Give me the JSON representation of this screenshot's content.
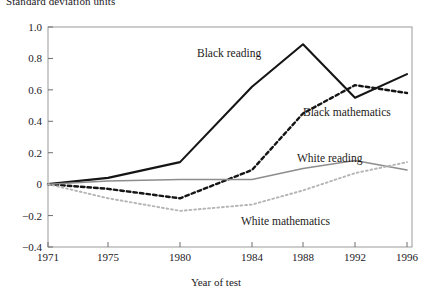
{
  "figure": {
    "y_axis_title": "Standard deviation units",
    "x_axis_title": "Year of test"
  },
  "chart_data": {
    "type": "line",
    "title": "",
    "ylabel": "Standard deviation units",
    "xlabel": "Year of test",
    "xlim": [
      1971,
      1996
    ],
    "ylim": [
      -0.4,
      1.0
    ],
    "grid": false,
    "legend_position": "inline-annotations",
    "xticks": [
      1971,
      1975,
      1980,
      1984,
      1988,
      1992,
      1996
    ],
    "xtick_labels": [
      "1971",
      "1975",
      "1980",
      "1984",
      "1988",
      "1992",
      "1996"
    ],
    "yticks": [
      -0.4,
      -0.2,
      0,
      0.2,
      0.4,
      0.6,
      0.8,
      1.0
    ],
    "ytick_labels": [
      "-0.4",
      "-0.2",
      "0",
      "0.2",
      "0.4",
      "0.6",
      "0.8",
      "1.0"
    ],
    "x": [
      1971,
      1975,
      1980,
      1984,
      1988,
      1992,
      1996
    ],
    "series": [
      {
        "name": "Black reading",
        "style": "solid",
        "color": "#151515",
        "width": 2.1,
        "values": [
          0.0,
          0.04,
          0.14,
          0.62,
          0.89,
          0.55,
          0.7
        ]
      },
      {
        "name": "Black mathematics",
        "style": "dashed",
        "color": "#151515",
        "width": 2.4,
        "values": [
          0.0,
          -0.03,
          -0.09,
          0.09,
          0.45,
          0.63,
          0.58
        ]
      },
      {
        "name": "White reading",
        "style": "solid",
        "color": "#8d8d8d",
        "width": 1.5,
        "values": [
          0.0,
          0.02,
          0.03,
          0.03,
          0.1,
          0.15,
          0.09
        ]
      },
      {
        "name": "White mathematics",
        "style": "dotted",
        "color": "#b5b5b5",
        "width": 1.9,
        "values": [
          0.0,
          -0.09,
          -0.17,
          -0.13,
          -0.04,
          0.07,
          0.14
        ]
      }
    ],
    "annotations": [
      {
        "text": "Black reading",
        "x_px": 197,
        "y_px": 47
      },
      {
        "text": "Black mathematics",
        "x_px": 303,
        "y_px": 106
      },
      {
        "text": "White reading",
        "x_px": 297,
        "y_px": 152
      },
      {
        "text": "White mathematics",
        "x_px": 241,
        "y_px": 215
      }
    ]
  }
}
